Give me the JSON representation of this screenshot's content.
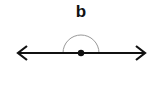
{
  "figure": {
    "label": "b",
    "colors": {
      "line": "#111111",
      "arc": "#999999",
      "label": "#111111"
    },
    "geometry": {
      "line_y": 53,
      "line_x_start": 17,
      "line_x_end": 146,
      "vertex_x": 81,
      "arc_radius": 18,
      "angle_degrees": 180
    }
  }
}
